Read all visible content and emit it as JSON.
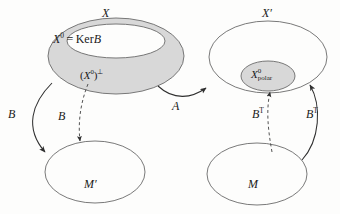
{
  "figure": {
    "background_color": "#fdfdfc",
    "line_color": "#3a3a3a",
    "shade_color": "#d8d8d8",
    "text_color": "#1a1a1a"
  },
  "regions": [
    {
      "id": "X",
      "name": "outer-set-X",
      "label": "X",
      "shape": "ellipse",
      "filled": true,
      "fill": "#d8d8d8",
      "cx": 116,
      "cy": 56,
      "rx": 68,
      "ry": 38
    },
    {
      "id": "X0",
      "name": "inner-set-kernel",
      "label_main": "X",
      "label_sup": "0",
      "label_rel": "=",
      "label_op": "Ker",
      "label_operand": "B",
      "label_full": "X0 = KerB",
      "shape": "ellipse",
      "filled": false,
      "fill": "#ffffff",
      "cx": 116,
      "cy": 41,
      "rx": 49,
      "ry": 17
    },
    {
      "id": "Xprime",
      "name": "outer-set-X-prime",
      "label": "X′",
      "shape": "ellipse",
      "filled": false,
      "fill": "#ffffff",
      "cx": 268,
      "cy": 57,
      "rx": 59,
      "ry": 36
    },
    {
      "id": "Xpolar",
      "name": "inner-set-polar",
      "label_main": "X",
      "label_sup": "0",
      "label_sub": "polar",
      "label_full": "X0 polar",
      "shape": "ellipse",
      "filled": true,
      "fill": "#d8d8d8",
      "cx": 268,
      "cy": 76,
      "rx": 27,
      "ry": 15
    },
    {
      "id": "Mprime",
      "name": "set-M-prime",
      "label": "M′",
      "shape": "ellipse",
      "filled": false,
      "fill": "#ffffff",
      "cx": 95,
      "cy": 172,
      "rx": 50,
      "ry": 31
    },
    {
      "id": "M",
      "name": "set-M",
      "label": "M",
      "shape": "ellipse",
      "filled": false,
      "fill": "#ffffff",
      "cx": 257,
      "cy": 174,
      "rx": 50,
      "ry": 31
    }
  ],
  "annotations": {
    "x_perp": {
      "name": "x-zero-perp-label",
      "open_paren": "(",
      "main": "X",
      "sup": "0",
      "close_paren": ")",
      "perp": "⊥",
      "full": "(X0)⊥"
    }
  },
  "arrows": [
    {
      "id": "B-left",
      "name": "arrow-B-outer-left",
      "label_main": "B",
      "label_sup": "",
      "style": "solid",
      "from": "X",
      "to": "M′",
      "description": "solid curve from left of X down to upper-left of M-prime"
    },
    {
      "id": "B-mid",
      "name": "arrow-B-dashed-left",
      "label_main": "B",
      "label_sup": "",
      "style": "dashed",
      "from": "(X0)⊥",
      "to": "M′",
      "description": "dashed curve from the perp region down into M-prime"
    },
    {
      "id": "A",
      "name": "arrow-A",
      "label_main": "A",
      "label_sup": "",
      "style": "solid",
      "from": "X",
      "to": "X′",
      "description": "solid curve from lower-right of X to lower-left of X-prime"
    },
    {
      "id": "BT-inner",
      "name": "arrow-BT-dashed-right",
      "label_main": "B",
      "label_sup": "T",
      "style": "dashed",
      "from": "M",
      "to": "X0 polar",
      "description": "dashed curve from M up into the polar set"
    },
    {
      "id": "BT-outer",
      "name": "arrow-BT-outer-right",
      "label_main": "B",
      "label_sup": "T",
      "style": "solid",
      "from": "M",
      "to": "X′",
      "description": "solid curve from right of M up to lower-right of X-prime"
    }
  ]
}
